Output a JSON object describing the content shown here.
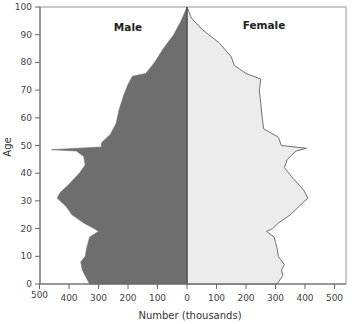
{
  "chart_data": {
    "type": "area",
    "subtype": "population-pyramid",
    "title": "",
    "xlabel": "Number (thousands)",
    "ylabel": "Age",
    "xlim": [
      -500,
      500
    ],
    "ylim": [
      0,
      100
    ],
    "grid": false,
    "legend": "none (series labelled inside plot)",
    "x_ticks": [
      500,
      400,
      300,
      200,
      100,
      0,
      100,
      200,
      300,
      400,
      500
    ],
    "y_ticks": [
      0,
      10,
      20,
      30,
      40,
      50,
      60,
      70,
      80,
      90,
      100
    ],
    "series": [
      {
        "name": "Male",
        "side": "left",
        "color": "#6e6e6e",
        "points": [
          [
            0,
            330
          ],
          [
            2,
            340
          ],
          [
            5,
            355
          ],
          [
            8,
            360
          ],
          [
            10,
            345
          ],
          [
            13,
            340
          ],
          [
            15,
            335
          ],
          [
            17,
            330
          ],
          [
            19,
            300
          ],
          [
            20,
            315
          ],
          [
            22,
            350
          ],
          [
            25,
            390
          ],
          [
            28,
            410
          ],
          [
            31,
            440
          ],
          [
            33,
            430
          ],
          [
            36,
            400
          ],
          [
            40,
            365
          ],
          [
            43,
            345
          ],
          [
            46,
            350
          ],
          [
            48,
            375
          ],
          [
            48.5,
            460
          ],
          [
            49.5,
            290
          ],
          [
            51,
            290
          ],
          [
            54,
            260
          ],
          [
            58,
            240
          ],
          [
            63,
            230
          ],
          [
            68,
            215
          ],
          [
            72,
            200
          ],
          [
            75,
            185
          ],
          [
            76,
            140
          ],
          [
            80,
            110
          ],
          [
            85,
            80
          ],
          [
            90,
            45
          ],
          [
            95,
            20
          ],
          [
            100,
            0
          ]
        ]
      },
      {
        "name": "Female",
        "side": "right",
        "color": "#ececec",
        "outline": "#707070",
        "points": [
          [
            0,
            305
          ],
          [
            3,
            325
          ],
          [
            5,
            320
          ],
          [
            7,
            330
          ],
          [
            10,
            310
          ],
          [
            13,
            305
          ],
          [
            15,
            300
          ],
          [
            17,
            295
          ],
          [
            19,
            270
          ],
          [
            20,
            290
          ],
          [
            22,
            310
          ],
          [
            25,
            350
          ],
          [
            28,
            380
          ],
          [
            31,
            410
          ],
          [
            34,
            395
          ],
          [
            38,
            360
          ],
          [
            42,
            330
          ],
          [
            45,
            340
          ],
          [
            48,
            370
          ],
          [
            49,
            405
          ],
          [
            50,
            320
          ],
          [
            53,
            310
          ],
          [
            56,
            260
          ],
          [
            60,
            255
          ],
          [
            65,
            250
          ],
          [
            70,
            245
          ],
          [
            74,
            250
          ],
          [
            76,
            200
          ],
          [
            79,
            160
          ],
          [
            82,
            150
          ],
          [
            87,
            110
          ],
          [
            92,
            50
          ],
          [
            96,
            15
          ],
          [
            100,
            0
          ]
        ]
      }
    ],
    "annotations": [
      "Male",
      "Female"
    ]
  },
  "labels": {
    "male": "Male",
    "female": "Female",
    "xlabel": "Number (thousands)",
    "ylabel": "Age"
  },
  "colors": {
    "male_fill": "#6e6e6e",
    "female_fill": "#ececec",
    "female_outline": "#707070",
    "frame": "#a8a8a8",
    "axis": "#666666"
  }
}
